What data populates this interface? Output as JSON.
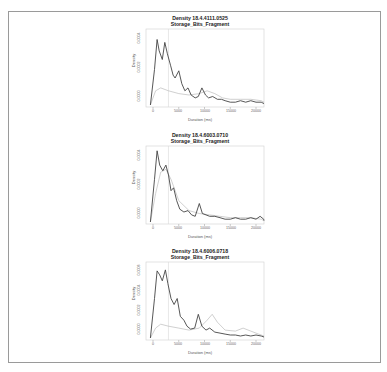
{
  "chart_data": [
    {
      "type": "line",
      "title": "Density 18.4.4111.0525\nStorage_Bits_Fragment",
      "title_line1": "Density 18.4.4111.0525",
      "title_line2": "Storage_Bits_Fragment",
      "xlabel": "Duration (ms)",
      "ylabel": "Density",
      "xlim": [
        0,
        22000
      ],
      "x_ticks": [
        "0",
        "5000",
        "10000",
        "15000",
        "20000"
      ],
      "y_ticks": [
        "0.0000",
        "0.0002",
        "0.0004"
      ],
      "vline_x": 3000,
      "series": [
        {
          "name": "primary",
          "color": "#444444",
          "x": [
            -500,
            300,
            800,
            1200,
            1800,
            2300,
            2800,
            3400,
            3900,
            4300,
            5000,
            5600,
            6200,
            6800,
            7400,
            8200,
            8800,
            9500,
            10200,
            10800,
            11600,
            12500,
            13300,
            14000,
            15000,
            16000,
            17000,
            18000,
            19000,
            20000,
            21000,
            22000
          ],
          "y": [
            0.0,
            0.00025,
            0.00046,
            0.00038,
            0.00032,
            0.00044,
            0.00036,
            0.00028,
            0.00021,
            0.00019,
            0.00024,
            0.00015,
            0.0001,
            0.00012,
            7e-05,
            5e-05,
            6e-05,
            0.00012,
            7e-05,
            5e-05,
            6e-05,
            4e-05,
            4e-05,
            3e-05,
            2e-05,
            2e-05,
            3e-05,
            2e-05,
            3e-05,
            2e-05,
            2e-05,
            1e-05
          ]
        },
        {
          "name": "secondary",
          "color": "#bbbbbb",
          "x": [
            -500,
            500,
            1500,
            3000,
            5000,
            7000,
            9000,
            10500,
            12000,
            13500,
            15000,
            17000,
            19000,
            21000,
            22000
          ],
          "y": [
            0.0,
            0.0001,
            0.00012,
            0.0001,
            8e-05,
            7e-05,
            8e-05,
            0.0001,
            8e-05,
            5e-05,
            4e-05,
            4e-05,
            4e-05,
            3e-05,
            2e-05
          ]
        }
      ]
    },
    {
      "type": "line",
      "title": "Density 18.4.6003.0710\nStorage_Bits_Fragment",
      "title_line1": "Density 18.4.6003.0710",
      "title_line2": "Storage_Bits_Fragment",
      "xlabel": "Duration (ms)",
      "ylabel": "Density",
      "xlim": [
        0,
        22000
      ],
      "x_ticks": [
        "0",
        "5000",
        "10000",
        "15000",
        "20000"
      ],
      "y_ticks": [
        "0.0000",
        "0.0002",
        "0.0004"
      ],
      "vline_x": 3000,
      "series": [
        {
          "name": "primary",
          "color": "#444444",
          "x": [
            -500,
            300,
            800,
            1300,
            1900,
            2500,
            3000,
            3500,
            4000,
            4600,
            5200,
            6000,
            6800,
            7500,
            8200,
            9000,
            9600,
            10300,
            11000,
            12000,
            13000,
            14000,
            15000,
            16000,
            17000,
            18000,
            19000,
            20000,
            20800,
            21500,
            22000
          ],
          "y": [
            0.0,
            0.0003,
            0.0005,
            0.0004,
            0.00036,
            0.0004,
            0.00033,
            0.00022,
            0.00024,
            0.00015,
            9e-05,
            7e-05,
            8e-05,
            5e-05,
            4e-05,
            0.00013,
            6e-05,
            5e-05,
            4e-05,
            4e-05,
            3e-05,
            2e-05,
            2e-05,
            3e-05,
            2e-05,
            2e-05,
            3e-05,
            2e-05,
            4e-05,
            2e-05,
            1e-05
          ]
        },
        {
          "name": "secondary",
          "color": "#bbbbbb",
          "x": [
            -500,
            500,
            1500,
            2500,
            3500,
            5000,
            7000,
            9000,
            11000,
            13000,
            15000,
            17000,
            19000,
            21000,
            22000
          ],
          "y": [
            0.0,
            0.0002,
            0.00035,
            0.00037,
            0.0003,
            0.00015,
            8e-05,
            6e-05,
            5e-05,
            4e-05,
            3e-05,
            3e-05,
            3e-05,
            2e-05,
            1e-05
          ]
        }
      ]
    },
    {
      "type": "line",
      "title": "Density 18.4.6006.0718\nStorage_Bits_Fragment",
      "title_line1": "Density 18.4.6006.0718",
      "title_line2": "Storage_Bits_Fragment",
      "xlabel": "Duration (ms)",
      "ylabel": "Density",
      "xlim": [
        0,
        22000
      ],
      "x_ticks": [
        "0",
        "5000",
        "10000",
        "15000",
        "20000"
      ],
      "y_ticks": [
        "0.0000",
        "0.0002",
        "0.0004",
        "0.0006"
      ],
      "vline_x": 3000,
      "series": [
        {
          "name": "primary",
          "color": "#444444",
          "x": [
            -500,
            300,
            800,
            1300,
            1800,
            2400,
            2900,
            3500,
            4100,
            4700,
            5300,
            6000,
            6600,
            7300,
            8100,
            8800,
            9500,
            10300,
            11000,
            12000,
            13000,
            14000,
            15000,
            16000,
            17000,
            18000,
            19000,
            20000,
            21000,
            22000
          ],
          "y": [
            0.0,
            0.0004,
            0.00068,
            0.00064,
            0.00058,
            0.00069,
            0.00055,
            0.0004,
            0.00034,
            0.0004,
            0.00022,
            0.00018,
            0.00012,
            9e-05,
            0.0001,
            0.00024,
            0.00012,
            8e-05,
            0.0001,
            6e-05,
            5e-05,
            4e-05,
            3e-05,
            3e-05,
            2e-05,
            3e-05,
            2e-05,
            3e-05,
            2e-05,
            1e-05
          ]
        },
        {
          "name": "secondary",
          "color": "#bbbbbb",
          "x": [
            -500,
            500,
            1500,
            3000,
            5000,
            7000,
            9000,
            10500,
            11500,
            12500,
            14000,
            16000,
            17500,
            19000,
            20500,
            22000
          ],
          "y": [
            0.0,
            0.0001,
            0.00014,
            0.00012,
            0.0001,
            8e-05,
            0.0001,
            0.00018,
            0.00024,
            0.00016,
            8e-05,
            7e-05,
            0.0001,
            7e-05,
            4e-05,
            2e-05
          ]
        }
      ]
    }
  ]
}
